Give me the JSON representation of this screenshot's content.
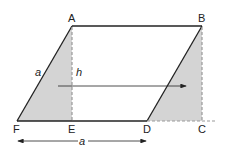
{
  "diagram": {
    "type": "geometry-parallelogram-to-rectangle",
    "points": {
      "A": {
        "label": "A",
        "x": 72,
        "y": 26
      },
      "B": {
        "label": "B",
        "x": 202,
        "y": 26
      },
      "C": {
        "label": "C",
        "x": 202,
        "y": 121
      },
      "D": {
        "label": "D",
        "x": 147,
        "y": 121
      },
      "E": {
        "label": "E",
        "x": 72,
        "y": 121
      },
      "F": {
        "label": "F",
        "x": 17,
        "y": 121
      }
    },
    "side_label": "a",
    "height_label": "h",
    "base_label": "a",
    "colors": {
      "line": "#222222",
      "shade": "#d4d4d4",
      "dashed": "#999999",
      "background": "#ffffff"
    }
  }
}
